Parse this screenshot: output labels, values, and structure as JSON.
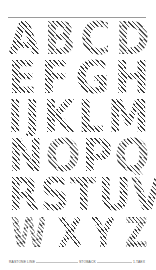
{
  "specimen": {
    "rows": [
      [
        "A",
        "B",
        "C",
        "D"
      ],
      [
        "E",
        "F",
        "G",
        "H"
      ],
      [
        "I",
        "J",
        "K",
        "L",
        "M"
      ],
      [
        "N",
        "O",
        "P",
        "Q"
      ],
      [
        "R",
        "S",
        "T",
        "U",
        "V"
      ],
      [
        "W",
        "X",
        "Y",
        "Z"
      ]
    ],
    "style": "diagonal-hatched display capitals",
    "hatch_color": "#3a3a3a",
    "background_color": "#ffffff"
  },
  "footer": {
    "left": "RASTONE LINE",
    "center": "STOBACK",
    "right": "1.TAEX"
  }
}
